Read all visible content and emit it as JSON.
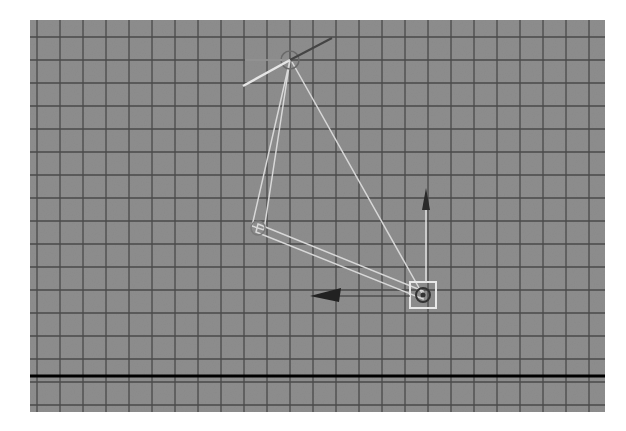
{
  "viewport": {
    "view": "side orthographic",
    "background_color": "#8e8e8e",
    "grid": {
      "line_color": "#4a4a4a",
      "spacing_px": 23,
      "origin_x": 7,
      "origin_y": 17
    },
    "ground_line": {
      "y": 356,
      "color": "#000000"
    }
  },
  "skeleton": {
    "color": "#d8d8d8",
    "joints": [
      {
        "name": "hip",
        "x": 260,
        "y": 40
      },
      {
        "name": "knee",
        "x": 228,
        "y": 208
      },
      {
        "name": "ankle",
        "x": 393,
        "y": 275
      }
    ]
  },
  "ik_handle": {
    "x": 393,
    "y": 275,
    "box_size": 26,
    "start_joint": "hip",
    "end_joint": "ankle"
  },
  "manipulators": {
    "move_left_arrow": {
      "from_x": 380,
      "to_x": 280,
      "y": 276
    },
    "move_up_arrow": {
      "x": 396,
      "from_y": 270,
      "to_y": 168
    },
    "hip_rotate_axis": {
      "x1": 213,
      "y1": 66,
      "x2": 302,
      "y2": 18
    }
  }
}
